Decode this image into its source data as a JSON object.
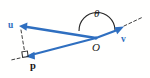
{
  "figure": {
    "kind": "vector-projection-diagram",
    "background_color": "#fffffe",
    "width": 150,
    "height": 78,
    "vector_color": "#2f6fc0",
    "label_color": "#1a1a1a",
    "dash_color": "#4a4a4a"
  },
  "labels": {
    "u": "u",
    "v": "v",
    "p": "p",
    "theta": "θ",
    "origin": "O"
  },
  "geometry": {
    "origin_point": [
      96,
      38
    ],
    "u_tip": [
      20,
      26
    ],
    "v_tip": [
      120,
      29
    ],
    "p_tip": [
      26,
      56
    ],
    "right_angle_marker": [
      24,
      54
    ],
    "angle_arc_label": "θ",
    "angle_arc_description": "arc from u direction to v direction centered at O"
  },
  "elements": {
    "vector_u_name": "vector-u",
    "vector_v_name": "vector-v",
    "vector_p_name": "vector-p",
    "dashed_drop_name": "dashed-perpendicular",
    "dashed_extension_name": "dashed-v-extension",
    "dashed_left_name": "dashed-left-stub",
    "right_angle_name": "right-angle-marker",
    "angle_arc_name": "angle-arc"
  }
}
